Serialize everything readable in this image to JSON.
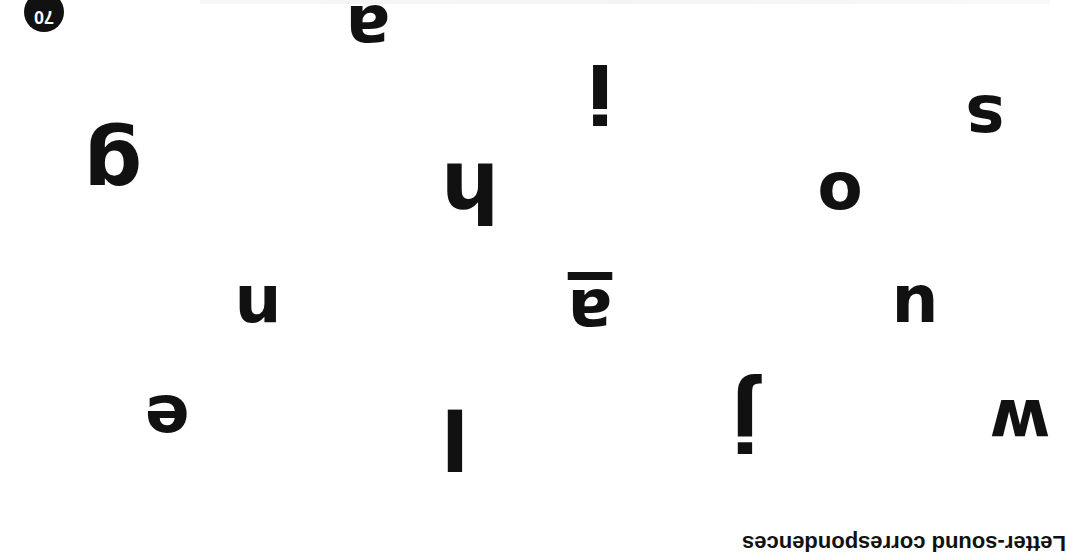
{
  "page": {
    "orientation": "rotated 180 degrees",
    "page_number": "70",
    "caption": "Letter-sound correspondences",
    "ink_color": "#111111",
    "background": "#ffffff"
  },
  "letters": [
    {
      "char": "a",
      "x": 368,
      "y": 28,
      "size": 66,
      "underlined": false
    },
    {
      "char": "i",
      "x": 600,
      "y": 92,
      "size": 80,
      "underlined": false
    },
    {
      "char": "s",
      "x": 985,
      "y": 118,
      "size": 66,
      "underlined": false
    },
    {
      "char": "g",
      "x": 113,
      "y": 168,
      "size": 82,
      "underlined": false
    },
    {
      "char": "h",
      "x": 470,
      "y": 192,
      "size": 82,
      "underlined": false
    },
    {
      "char": "o",
      "x": 840,
      "y": 195,
      "size": 66,
      "underlined": false
    },
    {
      "char": "n",
      "x": 258,
      "y": 308,
      "size": 66,
      "underlined": false
    },
    {
      "char": "a",
      "x": 590,
      "y": 312,
      "size": 66,
      "underlined": true
    },
    {
      "char": "u",
      "x": 915,
      "y": 308,
      "size": 66,
      "underlined": false
    },
    {
      "char": "e",
      "x": 167,
      "y": 418,
      "size": 66,
      "underlined": false
    },
    {
      "char": "l",
      "x": 455,
      "y": 438,
      "size": 82,
      "underlined": false
    },
    {
      "char": "j",
      "x": 745,
      "y": 420,
      "size": 82,
      "underlined": false
    },
    {
      "char": "w",
      "x": 1020,
      "y": 422,
      "size": 66,
      "underlined": false
    }
  ]
}
